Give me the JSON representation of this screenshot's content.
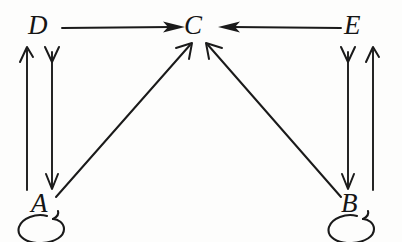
{
  "diagram": {
    "background_color": "#fdfdfc",
    "ink_color": "#1a1a1a",
    "nodes": [
      {
        "id": "A",
        "label": "A",
        "x": 42,
        "y": 205,
        "position": "bottom-left"
      },
      {
        "id": "B",
        "label": "B",
        "x": 352,
        "y": 205,
        "position": "bottom-right"
      },
      {
        "id": "C",
        "label": "C",
        "x": 196,
        "y": 28,
        "position": "top-center"
      },
      {
        "id": "D",
        "label": "D",
        "x": 40,
        "y": 28,
        "position": "top-left"
      },
      {
        "id": "E",
        "label": "E",
        "x": 355,
        "y": 28,
        "position": "top-right"
      }
    ],
    "edges": [
      {
        "from": "D",
        "to": "C",
        "kind": "straight",
        "direction": "right",
        "arrowhead": "solid"
      },
      {
        "from": "E",
        "to": "C",
        "kind": "straight",
        "direction": "left",
        "arrowhead": "solid"
      },
      {
        "from": "A",
        "to": "C",
        "kind": "diagonal",
        "direction": "up-right",
        "arrowhead": "open"
      },
      {
        "from": "B",
        "to": "C",
        "kind": "diagonal",
        "direction": "up-left",
        "arrowhead": "open"
      },
      {
        "from": "A",
        "to": "D",
        "kind": "vertical",
        "direction": "up",
        "arrowhead": "open"
      },
      {
        "from": "D",
        "to": "A",
        "kind": "vertical",
        "direction": "down",
        "arrowhead": "open"
      },
      {
        "from": "B",
        "to": "E",
        "kind": "vertical",
        "direction": "up",
        "arrowhead": "open"
      },
      {
        "from": "E",
        "to": "B",
        "kind": "vertical",
        "direction": "down",
        "arrowhead": "open"
      },
      {
        "from": "A",
        "to": "A",
        "kind": "self-loop",
        "direction": "below",
        "arrowhead": "hook"
      },
      {
        "from": "B",
        "to": "B",
        "kind": "self-loop",
        "direction": "below",
        "arrowhead": "hook"
      }
    ]
  }
}
